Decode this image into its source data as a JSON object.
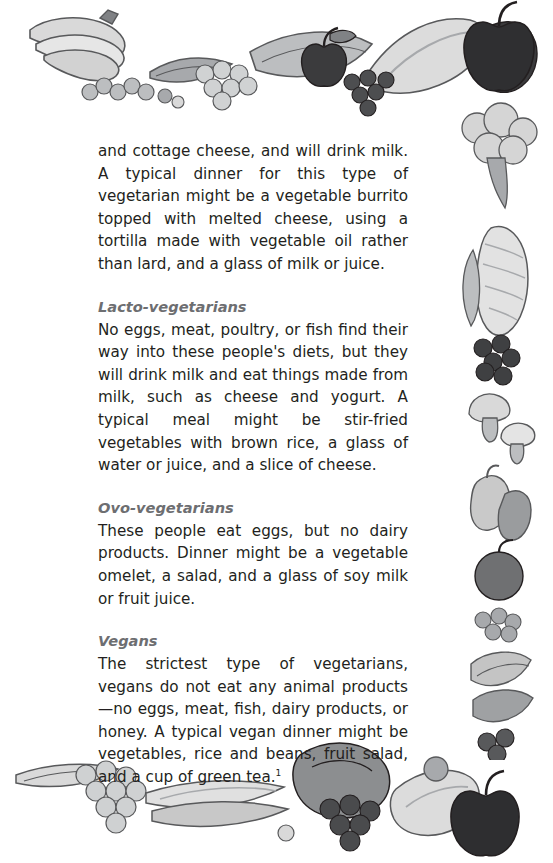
{
  "page": {
    "background_color": "#ffffff",
    "text_color": "#231f20",
    "heading_color": "#6d6e71"
  },
  "body": {
    "intro_paragraph": "and cottage cheese, and will drink milk. A typical dinner for this type of vegetarian might be a vegetable burrito topped with melted cheese, using a tortilla made with vegetable oil rather than lard, and a glass of milk or juice."
  },
  "sections": [
    {
      "heading": "Lacto-vegetarians",
      "paragraph": "No eggs, meat, poultry, or fish find their way into these people's diets, but they will drink milk and eat things made from milk, such as cheese and yogurt. A typical meal might be stir-fried vegetables with brown rice, a glass of water or juice, and a slice of cheese."
    },
    {
      "heading": "Ovo-vegetarians",
      "paragraph": "These people eat eggs, but no dairy products. Dinner might be a vegetable omelet, a salad, and a glass of soy milk or fruit juice."
    },
    {
      "heading": "Vegans",
      "paragraph": "The strictest type of vegetarians, vegans do not eat any animal products—no eggs, meat, fish, dairy products, or honey. A typical vegan dinner might be vegetables, rice and beans, fruit salad, and a cup of green tea",
      "footnote_marker": "1"
    }
  ],
  "decorations": {
    "top_border": "fruit-and-vegetable-border-top",
    "right_border": "fruit-and-vegetable-border-right",
    "bottom_border": "fruit-and-vegetable-border-bottom",
    "palette": {
      "light_gray": "#d9d9d9",
      "mid_gray": "#a7a9ac",
      "dark_gray": "#58595b",
      "near_black": "#231f20",
      "pale": "#efefef"
    }
  }
}
